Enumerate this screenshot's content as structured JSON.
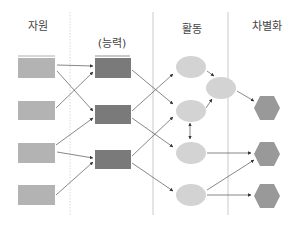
{
  "headers": {
    "resources": "자원",
    "capabilities": "(능력)",
    "activities": "활동",
    "differentiation": "차별화"
  },
  "colors": {
    "resource": "#b3b3b3",
    "capability": "#7a7a7a",
    "activity": "#d3d3d3",
    "differentiation": "#999999",
    "divider": "#bdbdbd",
    "arrow": "#555555"
  },
  "nodes": {
    "resources": [
      {
        "id": "R1"
      },
      {
        "id": "R2"
      },
      {
        "id": "R3"
      },
      {
        "id": "R4"
      }
    ],
    "capabilities": [
      {
        "id": "C1"
      },
      {
        "id": "C2"
      },
      {
        "id": "C3"
      }
    ],
    "activities": [
      {
        "id": "A1"
      },
      {
        "id": "A2"
      },
      {
        "id": "A3"
      },
      {
        "id": "A4"
      },
      {
        "id": "A5"
      }
    ],
    "differentiation": [
      {
        "id": "H1"
      },
      {
        "id": "H2"
      },
      {
        "id": "H3"
      }
    ]
  },
  "edges": [
    {
      "from": "R1",
      "to": "C1"
    },
    {
      "from": "R1",
      "to": "C2"
    },
    {
      "from": "R2",
      "to": "C1"
    },
    {
      "from": "R3",
      "to": "C2"
    },
    {
      "from": "R3",
      "to": "C3"
    },
    {
      "from": "R4",
      "to": "C3"
    },
    {
      "from": "C1",
      "to": "A3"
    },
    {
      "from": "C2",
      "to": "A1"
    },
    {
      "from": "C2",
      "to": "A4"
    },
    {
      "from": "C3",
      "to": "A3"
    },
    {
      "from": "C3",
      "to": "A5"
    },
    {
      "from": "A1",
      "to": "A2"
    },
    {
      "from": "A3",
      "to": "A2"
    },
    {
      "from": "A3",
      "to": "A4",
      "bidirectional": true
    },
    {
      "from": "A2",
      "to": "H1"
    },
    {
      "from": "A4",
      "to": "H2"
    },
    {
      "from": "A5",
      "to": "H2"
    },
    {
      "from": "A5",
      "to": "H3"
    }
  ]
}
